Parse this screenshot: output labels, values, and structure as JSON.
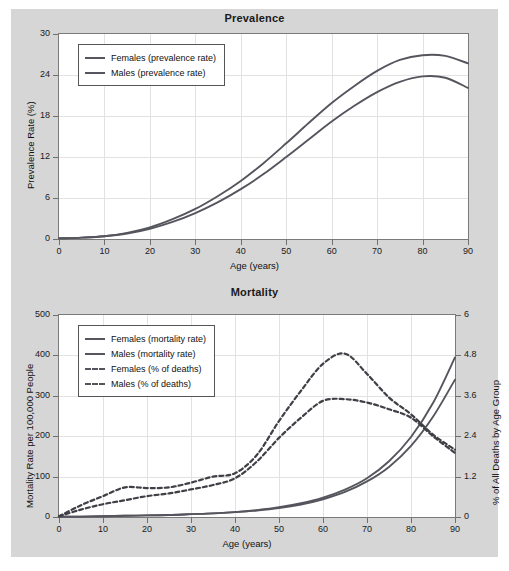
{
  "figure": {
    "background_color": "#d6d6d6",
    "plot_background": "#ffffff",
    "line_color": "#55555e",
    "grid_color": "#e2e2e2"
  },
  "charts": {
    "prevalence": {
      "title": "Prevalence",
      "xlabel": "Age (years)",
      "ylabel": "Prevalence Rate (%)",
      "xticks": [
        "0",
        "10",
        "20",
        "30",
        "40",
        "50",
        "60",
        "70",
        "80",
        "90"
      ],
      "yticks": [
        "0",
        "6",
        "12",
        "18",
        "24",
        "30"
      ],
      "legend": [
        {
          "label": "Females (prevalence rate)",
          "style": "solid"
        },
        {
          "label": "Males (prevalence rate)",
          "style": "solid"
        }
      ]
    },
    "mortality": {
      "title": "Mortality",
      "xlabel": "Age (years)",
      "ylabel_left": "Mortality Rate per 100,000 People",
      "ylabel_right": "% of All Deaths by Age Group",
      "xticks": [
        "0",
        "10",
        "20",
        "30",
        "40",
        "50",
        "60",
        "70",
        "80",
        "90"
      ],
      "yticks_left": [
        "0",
        "100",
        "200",
        "300",
        "400",
        "500"
      ],
      "yticks_right": [
        "0",
        "1.2",
        "2.4",
        "3.6",
        "4.8",
        "6"
      ],
      "legend": [
        {
          "label": "Females (mortality rate)",
          "style": "solid"
        },
        {
          "label": "Males (mortality rate)",
          "style": "solid"
        },
        {
          "label": "Females (% of deaths)",
          "style": "dashed"
        },
        {
          "label": "Males (% of deaths)",
          "style": "dashed"
        }
      ]
    }
  },
  "chart_data": [
    {
      "type": "line",
      "id": "prevalence",
      "title": "Prevalence",
      "xlabel": "Age (years)",
      "ylabel": "Prevalence Rate (%)",
      "xlim": [
        0,
        90
      ],
      "ylim": [
        0,
        30
      ],
      "xticks": [
        0,
        10,
        20,
        30,
        40,
        50,
        60,
        70,
        80,
        90
      ],
      "yticks": [
        0,
        6,
        12,
        18,
        24,
        30
      ],
      "grid": true,
      "legend_position": "upper-left",
      "x": [
        0,
        5,
        10,
        15,
        20,
        25,
        30,
        35,
        40,
        45,
        50,
        55,
        60,
        65,
        70,
        75,
        80,
        85,
        90
      ],
      "series": [
        {
          "name": "Females (prevalence rate)",
          "style": "solid",
          "color": "#55555e",
          "values": [
            0.1,
            0.2,
            0.4,
            0.9,
            1.7,
            2.9,
            4.4,
            6.3,
            8.5,
            11.1,
            14.0,
            17.0,
            19.9,
            22.4,
            24.6,
            26.2,
            26.9,
            26.8,
            25.7
          ]
        },
        {
          "name": "Males (prevalence rate)",
          "style": "solid",
          "color": "#55555e",
          "values": [
            0.1,
            0.2,
            0.4,
            0.8,
            1.5,
            2.5,
            3.8,
            5.4,
            7.3,
            9.5,
            12.0,
            14.6,
            17.2,
            19.5,
            21.5,
            23.0,
            23.8,
            23.6,
            22.1
          ]
        }
      ]
    },
    {
      "type": "line",
      "id": "mortality",
      "title": "Mortality",
      "xlabel": "Age (years)",
      "ylabel_left": "Mortality Rate per 100,000 People",
      "ylabel_right": "% of All Deaths by Age Group",
      "xlim": [
        0,
        90
      ],
      "ylim_left": [
        0,
        500
      ],
      "ylim_right": [
        0,
        6
      ],
      "xticks": [
        0,
        10,
        20,
        30,
        40,
        50,
        60,
        70,
        80,
        90
      ],
      "yticks_left": [
        0,
        100,
        200,
        300,
        400,
        500
      ],
      "yticks_right": [
        0,
        1.2,
        2.4,
        3.6,
        4.8,
        6
      ],
      "grid": true,
      "legend_position": "upper-left",
      "x": [
        0,
        5,
        10,
        15,
        20,
        25,
        30,
        35,
        40,
        45,
        50,
        55,
        60,
        65,
        70,
        75,
        80,
        85,
        90
      ],
      "series": [
        {
          "name": "Females (mortality rate)",
          "style": "solid",
          "color": "#55555e",
          "axis": "left",
          "values": [
            1,
            1,
            2,
            3,
            4,
            5,
            7,
            9,
            12,
            17,
            24,
            34,
            48,
            68,
            96,
            138,
            198,
            282,
            395
          ]
        },
        {
          "name": "Males (mortality rate)",
          "style": "solid",
          "color": "#55555e",
          "axis": "left",
          "values": [
            1,
            1,
            2,
            3,
            4,
            5,
            7,
            9,
            12,
            16,
            22,
            31,
            44,
            62,
            88,
            124,
            176,
            248,
            340
          ]
        },
        {
          "name": "Females (% of deaths)",
          "style": "dashed",
          "color": "#3f3f46",
          "axis": "right",
          "values": [
            0.02,
            0.35,
            0.62,
            0.88,
            0.86,
            0.88,
            1.02,
            1.2,
            1.3,
            1.85,
            2.85,
            3.75,
            4.55,
            4.85,
            4.25,
            3.55,
            3.05,
            2.45,
            2.0
          ]
        },
        {
          "name": "Males (% of deaths)",
          "style": "dashed",
          "color": "#3f3f46",
          "axis": "right",
          "values": [
            0.02,
            0.22,
            0.38,
            0.5,
            0.62,
            0.7,
            0.82,
            0.95,
            1.15,
            1.65,
            2.35,
            2.95,
            3.45,
            3.5,
            3.4,
            3.2,
            2.95,
            2.4,
            1.9
          ]
        }
      ]
    }
  ]
}
